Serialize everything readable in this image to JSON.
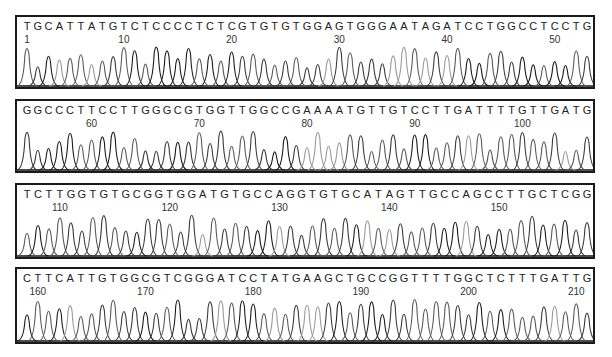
{
  "chart_data": {
    "type": "line",
    "title": "",
    "xlabel": "Base position",
    "ylabel": "Fluorescence intensity",
    "grid": false,
    "legend": null,
    "rows": [
      {
        "sequence": "TGCATTATGTCTCCCCTCTCGTGTGTGGAGTGGGAATAGATCCTGGCCTCCTG",
        "start": 1,
        "ticks": [
          "1",
          "10",
          "20",
          "30",
          "40",
          "50"
        ]
      },
      {
        "sequence": "GGCCCTTCCTTGGGCGTGGTTGGCCGAAAATGTTGTCCTTGATTTTGTTGATG",
        "start": 54,
        "ticks": [
          "60",
          "70",
          "80",
          "90",
          "100"
        ]
      },
      {
        "sequence": "TCTTGGTGTGCGGTGGATGTGCCAGGTGTGCATAGTTGCCAGCCTTGCTCGG",
        "start": 107,
        "ticks": [
          "110",
          "120",
          "130",
          "140",
          "150"
        ]
      },
      {
        "sequence": "CTTCATTGTGGCGTCGGGATCCTATGAAGCTGCCGGTTTTGGCTCTTTGATTG",
        "start": 159,
        "ticks": [
          "160",
          "170",
          "180",
          "190",
          "200",
          "210"
        ]
      }
    ]
  }
}
